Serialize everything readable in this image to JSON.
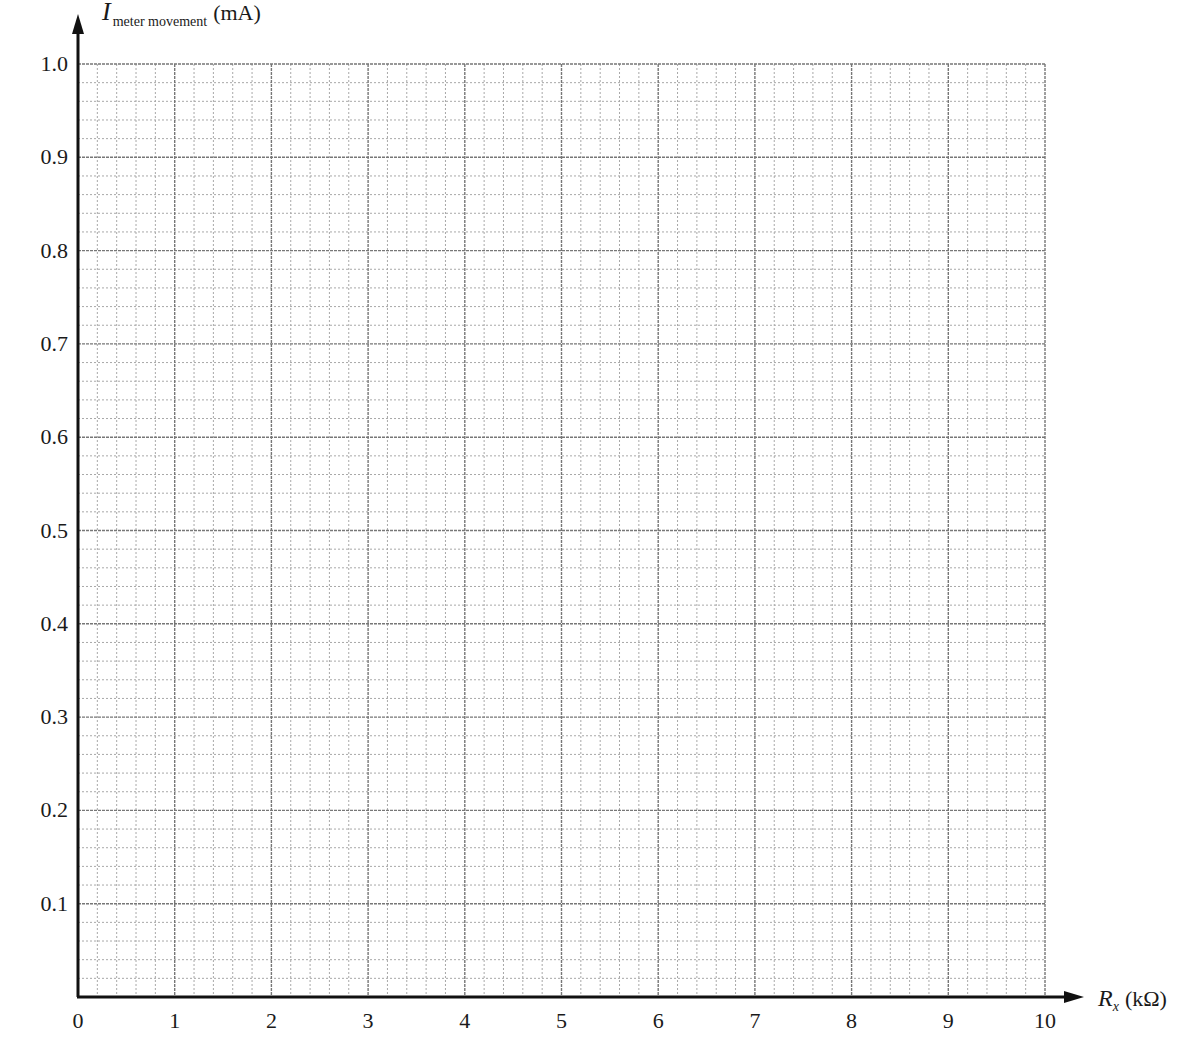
{
  "chart_data": {
    "type": "line",
    "title": "",
    "xlabel": "R_x (kΩ)",
    "ylabel": "I_meter movement (mA)",
    "xlabel_parts": {
      "symbol": "R",
      "subscript": "x",
      "unit": "(kΩ)"
    },
    "ylabel_parts": {
      "symbol": "I",
      "subscript": "meter movement",
      "unit": "(mA)"
    },
    "xlim": [
      0,
      10
    ],
    "ylim": [
      0,
      1.0
    ],
    "x_ticks": [
      "0",
      "1",
      "2",
      "3",
      "4",
      "5",
      "6",
      "7",
      "8",
      "9",
      "10"
    ],
    "y_ticks": [
      "0.1",
      "0.2",
      "0.3",
      "0.4",
      "0.5",
      "0.6",
      "0.7",
      "0.8",
      "0.9",
      "1.0"
    ],
    "x_minor_per_major": 5,
    "y_minor_per_major": 5,
    "grid": true,
    "series": []
  },
  "colors": {
    "axis": "#111111",
    "major_grid": "#777777",
    "minor_grid": "#a8a8a8",
    "text": "#1a1a1a"
  }
}
